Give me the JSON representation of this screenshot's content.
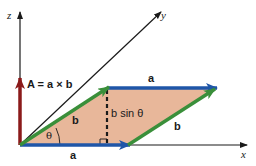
{
  "diagram": {
    "type": "vector-cross-product-parallelogram",
    "axes": {
      "x_label": "x",
      "y_label": "y",
      "z_label": "z"
    },
    "vectors": {
      "a_bottom_label": "a",
      "a_top_label": "a",
      "b_left_label": "b",
      "b_right_label": "b",
      "cross_product_label": "A = a × b"
    },
    "annotations": {
      "angle_label": "θ",
      "height_label": "b sin θ"
    },
    "colors": {
      "parallelogram_fill": "#e8b79a",
      "vector_a": "#1f56a8",
      "vector_b": "#3a8f3a",
      "vector_A": "#8b1a1a",
      "axis": "#1a1a1a"
    }
  }
}
